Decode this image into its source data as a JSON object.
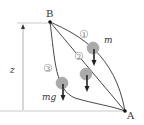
{
  "diagram": {
    "points": {
      "B": {
        "label": "B",
        "x": 50,
        "y": 22
      },
      "A": {
        "label": "A",
        "x": 125,
        "y": 111
      }
    },
    "paths": [
      {
        "id": "1",
        "label": "①",
        "shape": "convex-curve"
      },
      {
        "id": "2",
        "label": "②",
        "shape": "straight-line"
      },
      {
        "id": "3",
        "label": "③",
        "shape": "concave-curve"
      }
    ],
    "mass_label": "m",
    "weight_label": "mg",
    "height_label": "z",
    "colors": {
      "line": "#333333",
      "ball": "#aaaaaa",
      "ball_stroke": "#999999",
      "arrow": "#222222",
      "dimension": "#999999"
    }
  }
}
